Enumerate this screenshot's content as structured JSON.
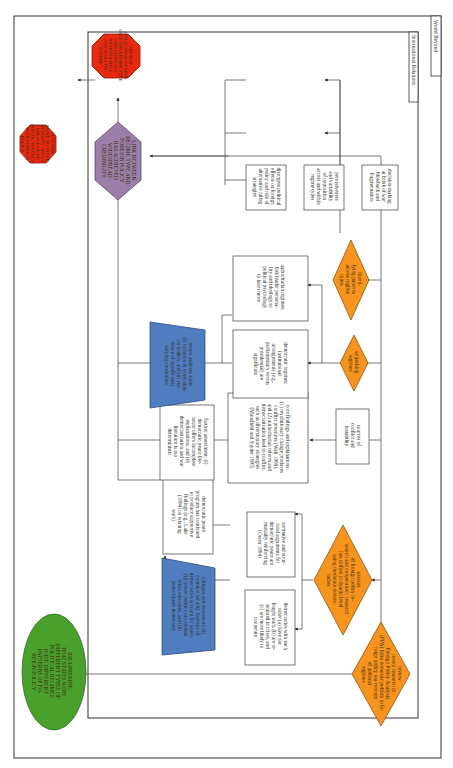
{
  "labels": {
    "outer": "World Beyond",
    "inner": "International Relations"
  },
  "colors": {
    "green": "#4aa02c",
    "orange": "#f7941d",
    "blue": "#4f7dbf",
    "purple": "#9c7fa8",
    "red": "#e8280f"
  },
  "nodes": {
    "start": [
      "IDEA/PREMISE:",
      "THAT STATES WITH",
      "DIFFERENT TYPES OF",
      "POLITICAL REGIMES",
      "HAVE DIFFERENT",
      "PATTERNS OF FO-",
      "REIGN POLICY"
    ],
    "review": [
      "review",
      "recent research in",
      "Foreign Policy Analysis",
      "(FPA) links domestic politics to fo-",
      "reign policy via concept",
      "of political",
      "regimes"
    ],
    "sources_fp": [
      "sources",
      "of foreign policy re-",
      "search and cooperation: research",
      "has shifted to dyadic level",
      "using moderate democ-",
      "racies"
    ],
    "dem_each_other": [
      "democracies with each",
      "other (a) have not",
      "fought wars, (b) are re-",
      "strained in crises, and",
      "(c) are more likely to",
      "cooperate"
    ],
    "normative": [
      "normative and struc-",
      "tural arguments for",
      "democratic peace are",
      "mutually reinforcing",
      "(Owen 1994)"
    ],
    "critiques": [
      "critiques and extensions: (i)",
      "common security interests of",
      "democracies account for peace,",
      "(ii) power politics can explain",
      "crisis outcomes, and (iii)",
      "peace causes democracy"
    ],
    "dp_program": [
      "democratic peace",
      "program has continued",
      "to produce supportive",
      "findings (e.g., Lake",
      "(1994) on winning",
      "wars)"
    ],
    "sources_conflict": [
      "sources of",
      "conflict and",
      "instability"
    ],
    "core_findings": [
      "core findings and explanations:",
      "(1) revolutionary change produces",
      "conflict pressures (Walt 1996);",
      "and (2) authoritarian reform and",
      "democratization lead to conflict,",
      "such as diversionary strategies",
      "(Mansfield and Snyder 1995)"
    ],
    "further_assessment": [
      "further assessment: (i)",
      "democratic peace lite-",
      "rature offers incomplete",
      "explanations, and (ii)",
      "democratization and war",
      "literature is too",
      "deterministic"
    ],
    "unpacking": [
      "unpacking",
      "regimes"
    ],
    "democratic_regimes": [
      "democratic regimes:",
      "institutional",
      "arrangements (e.g.,",
      "parliamentary versus",
      "presidential) are",
      "significant"
    ],
    "authoritarian_regimes": [
      "authoritarian regimes:",
      "link leader persona-",
      "lity and ideology to",
      "political psychology",
      "to learn more"
    ],
    "recent_analyses": [
      "recent analyses show",
      "(i) variation in constraints",
      "on leaders, and (ii) evi-",
      "dence of significantly",
      "varying constraints"
    ],
    "identifying": [
      "identi-",
      "fying patterns",
      "across regime",
      "types"
    ],
    "divergent": [
      "divergent political",
      "effects on foreign",
      "policy and role of",
      "alternative ruling",
      "strategies"
    ],
    "pervasiveness": [
      "pervasiveness",
      "and variability",
      "of opposition",
      "across and within",
      "regime types"
    ],
    "decision_making": [
      "decision-making",
      "at brink of war",
      "blowback and",
      "fragmentation"
    ],
    "link": [
      "LINK BETWEEN",
      "REGIME TYPE AND",
      "FOREIGN POLICY",
      "HAS ACHIEVED",
      "WIDESPREAD",
      "CREDIBILITY"
    ],
    "outcome_world": [
      "OUTCOME:",
      "MORE NUANCED",
      "INSIGHTS ABOUT",
      "LINKAGE OF DO-",
      "MESTIC POLITICS",
      "WITH FOREIGN",
      "POLICY"
    ],
    "outcome_ir": [
      "SEE BOX",
      "APPLICATION OF FIND-",
      "INGS FOR REGIME TYPE",
      "AND CONFLICT",
      "WITH POLITICS",
      "AND WAR LITE-",
      "RATURE"
    ]
  }
}
